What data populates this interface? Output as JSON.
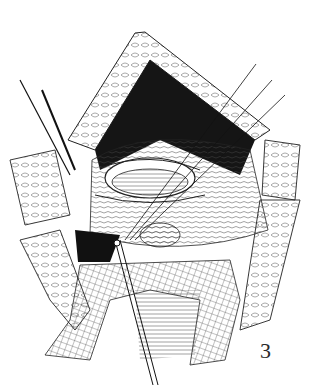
{
  "figure": {
    "type": "surgical-line-illustration",
    "label": "3",
    "colors": {
      "ink": "#1a1a1a",
      "background": "#ffffff"
    }
  }
}
